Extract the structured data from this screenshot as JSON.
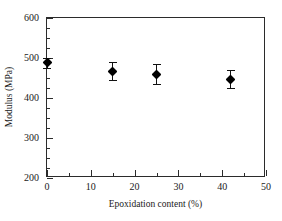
{
  "chart_data": {
    "type": "scatter",
    "title": "",
    "xlabel": "Epoxidation content (%)",
    "ylabel": "Modulus (MPa)",
    "xlim": [
      0,
      50
    ],
    "ylim": [
      200,
      600
    ],
    "xticks": [
      0,
      10,
      20,
      30,
      40,
      50
    ],
    "yticks": [
      200,
      300,
      400,
      500,
      600
    ],
    "xtick_labels": [
      "0",
      "10",
      "20",
      "30",
      "40",
      "50"
    ],
    "ytick_labels": [
      "200",
      "300",
      "400",
      "500",
      "600"
    ],
    "x_minor_interval": 5,
    "y_minor_interval": 25,
    "grid": false,
    "legend": false,
    "marker": "filled-diamond",
    "marker_color": "#000000",
    "series": [
      {
        "name": "Modulus",
        "x": [
          0,
          15,
          25,
          42
        ],
        "y": [
          488,
          467,
          459,
          447
        ],
        "yerr": [
          12,
          23,
          25,
          22
        ]
      }
    ]
  },
  "axes": {
    "frame_color": "#2b2b2b",
    "background": "#ffffff"
  }
}
